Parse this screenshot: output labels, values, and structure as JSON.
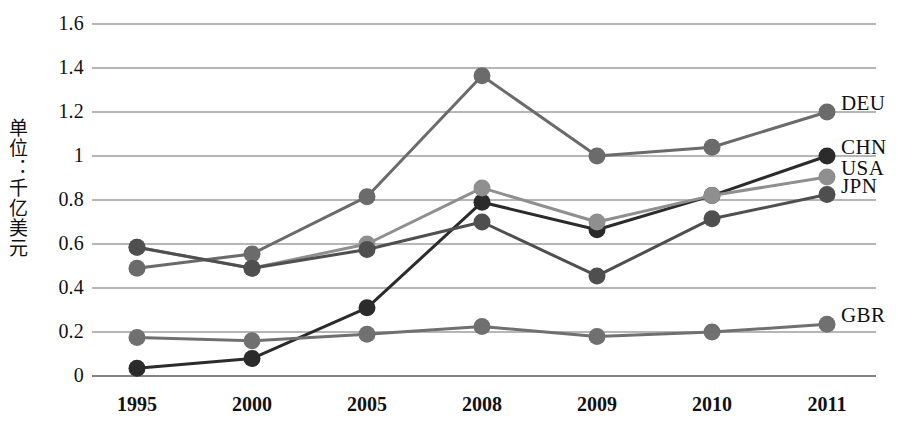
{
  "chart_data": {
    "type": "line",
    "title": "",
    "subtitle": "",
    "xlabel": "",
    "ylabel": "单位：千亿美元",
    "categories": [
      "1995",
      "2000",
      "2005",
      "2008",
      "2009",
      "2010",
      "2011"
    ],
    "ylim": [
      0,
      1.6
    ],
    "yticks": [
      "0",
      "0.2",
      "0.4",
      "0.6",
      "0.8",
      "1",
      "1.2",
      "1.4",
      "1.6"
    ],
    "ytick_values": [
      0,
      0.2,
      0.4,
      0.6,
      0.8,
      1.0,
      1.2,
      1.4,
      1.6
    ],
    "grid": true,
    "legend_position": "right-inline-end-of-line",
    "series": [
      {
        "name": "DEU",
        "color": "#6b6b6b",
        "values": [
          0.49,
          0.555,
          0.815,
          1.365,
          1.0,
          1.04,
          1.2
        ]
      },
      {
        "name": "CHN",
        "color": "#2b2b2b",
        "values": [
          0.035,
          0.08,
          0.31,
          0.79,
          0.665,
          0.82,
          1.0
        ]
      },
      {
        "name": "USA",
        "color": "#8f8f8f",
        "values": [
          0.585,
          0.49,
          0.6,
          0.855,
          0.7,
          0.82,
          0.905
        ]
      },
      {
        "name": "JPN",
        "color": "#4f4f4f",
        "values": [
          0.585,
          0.49,
          0.575,
          0.7,
          0.455,
          0.715,
          0.825
        ]
      },
      {
        "name": "GBR",
        "color": "#707070",
        "values": [
          0.175,
          0.16,
          0.19,
          0.225,
          0.18,
          0.2,
          0.235
        ]
      }
    ]
  },
  "axis": {
    "grid_color": "#6f6f6f",
    "baseline_color": "#5a5a5a"
  }
}
